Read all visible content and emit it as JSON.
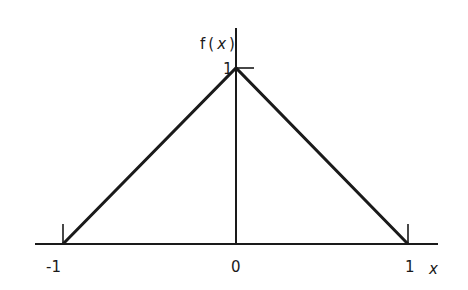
{
  "diagram": {
    "type": "triangle-function-plot",
    "function_label": "f(x)",
    "function_label_parts": [
      "f",
      "(",
      "x",
      ")"
    ],
    "x_axis_label": "x",
    "peak_label": "1",
    "x_tick_labels": [
      "-1",
      "0",
      "1"
    ],
    "points": [
      {
        "x": -1,
        "y": 0
      },
      {
        "x": 0,
        "y": 1
      },
      {
        "x": 1,
        "y": 0
      }
    ],
    "stroke_color": "#1a1a1a",
    "background": "#ffffff"
  }
}
